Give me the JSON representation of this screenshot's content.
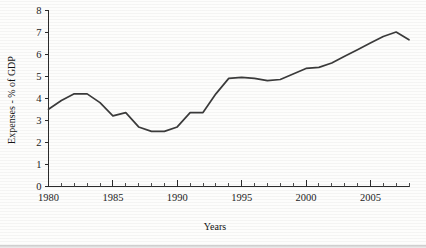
{
  "chart_data": {
    "type": "line",
    "title": "",
    "xlabel": "Years",
    "ylabel": "Expenses - % of GDP",
    "xlim": [
      1980,
      2008
    ],
    "ylim": [
      0,
      8
    ],
    "ytick_step": 1,
    "xtick_step_major": 5,
    "xtick_step_minor": 1,
    "grid": false,
    "legend": false,
    "legend_position": "none",
    "line_color": "#3b3b3b",
    "axis_color": "#2b2b2b",
    "yticks": [
      "0",
      "1",
      "2",
      "3",
      "4",
      "5",
      "6",
      "7",
      "8"
    ],
    "xticks": [
      "1980",
      "1985",
      "1990",
      "1995",
      "2000",
      "2005"
    ],
    "x": [
      1980,
      1981,
      1982,
      1983,
      1984,
      1985,
      1986,
      1987,
      1988,
      1989,
      1990,
      1991,
      1992,
      1993,
      1994,
      1995,
      1996,
      1997,
      1998,
      1999,
      2000,
      2001,
      2002,
      2003,
      2004,
      2005,
      2006,
      2007,
      2008
    ],
    "values": [
      3.5,
      3.9,
      4.2,
      4.2,
      3.8,
      3.2,
      3.35,
      2.7,
      2.5,
      2.5,
      2.7,
      3.35,
      3.35,
      4.2,
      4.9,
      4.95,
      4.9,
      4.8,
      4.85,
      5.1,
      5.35,
      5.4,
      5.6,
      5.9,
      6.2,
      6.5,
      6.8,
      7.0,
      6.65
    ],
    "series": [
      {
        "name": "Expenses",
        "values": [
          3.5,
          3.9,
          4.2,
          4.2,
          3.8,
          3.2,
          3.35,
          2.7,
          2.5,
          2.5,
          2.7,
          3.35,
          3.35,
          4.2,
          4.9,
          4.95,
          4.9,
          4.8,
          4.85,
          5.1,
          5.35,
          5.4,
          5.6,
          5.9,
          6.2,
          6.5,
          6.8,
          7.0,
          6.65
        ]
      }
    ],
    "annotations": []
  }
}
